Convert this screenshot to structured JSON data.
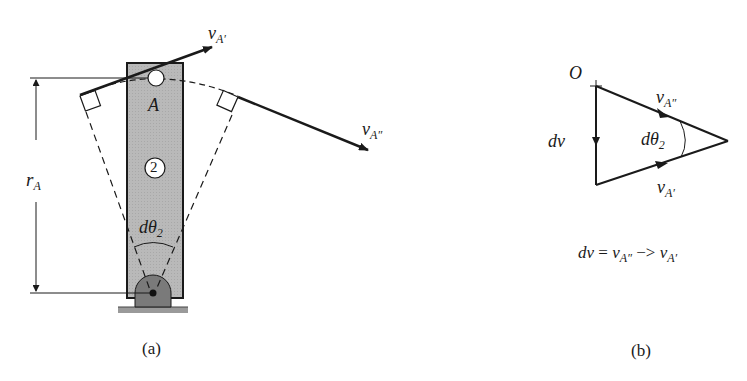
{
  "figure_a": {
    "caption": "(a)",
    "labels": {
      "v_A_prime": {
        "main": "v",
        "sub": "A′"
      },
      "v_A_double_prime": {
        "main": "v",
        "sub": "A″"
      },
      "point_A": "A",
      "link_number": "2",
      "r_A": {
        "main": "r",
        "sub": "A"
      },
      "d_theta_2": {
        "main": "dθ",
        "sub": "2"
      }
    }
  },
  "figure_b": {
    "caption": "(b)",
    "labels": {
      "origin": "O",
      "dv": "dv",
      "v_A_double_prime": {
        "main": "v",
        "sub": "A″"
      },
      "v_A_prime": {
        "main": "v",
        "sub": "A′"
      },
      "d_theta_2": {
        "main": "dθ",
        "sub": "2"
      }
    },
    "equation": {
      "lhs": "dv",
      "equals": "=",
      "term1": {
        "main": "v",
        "sub": "A″"
      },
      "operator": "−>",
      "term2": {
        "main": "v",
        "sub": "A′"
      }
    }
  },
  "colors": {
    "link_fill": "#b8b8b8",
    "pivot_fill": "#7a7a7a",
    "ground_fill": "#9a9a9a",
    "line": "#1a1a1a"
  }
}
